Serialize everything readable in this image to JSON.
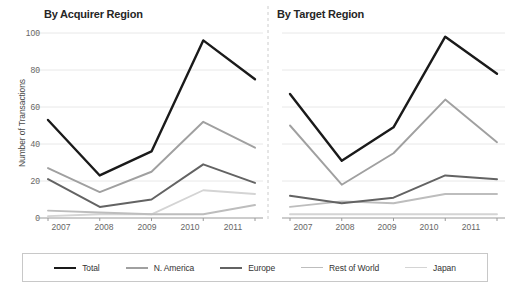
{
  "chart_data": [
    {
      "type": "line",
      "title": "By Acquirer Region",
      "xlabel": "",
      "ylabel": "Number of Transactions",
      "categories": [
        "2007",
        "2008",
        "2009",
        "2010",
        "2011"
      ],
      "ylim": [
        0,
        100
      ],
      "yticks": [
        0,
        20,
        40,
        60,
        80,
        100
      ],
      "grid": "horizontal",
      "legend_position": "bottom",
      "series": [
        {
          "name": "Total",
          "values": [
            53,
            23,
            36,
            96,
            75
          ],
          "color": "#1a1a1a"
        },
        {
          "name": "N. America",
          "values": [
            27,
            14,
            25,
            52,
            38
          ],
          "color": "#a0a0a0"
        },
        {
          "name": "Europe",
          "values": [
            21,
            6,
            10,
            29,
            19
          ],
          "color": "#636363"
        },
        {
          "name": "Rest of World",
          "values": [
            4,
            3,
            2,
            2,
            7
          ],
          "color": "#bdbdbd"
        },
        {
          "name": "Japan",
          "values": [
            1,
            2,
            2,
            15,
            13
          ],
          "color": "#d4d4d4"
        }
      ]
    },
    {
      "type": "line",
      "title": "By Target Region",
      "xlabel": "",
      "ylabel": "Number of Transactions",
      "categories": [
        "2007",
        "2008",
        "2009",
        "2010",
        "2011"
      ],
      "ylim": [
        0,
        100
      ],
      "yticks": [
        0,
        20,
        40,
        60,
        80,
        100
      ],
      "grid": "horizontal",
      "legend_position": "bottom",
      "series": [
        {
          "name": "Total",
          "values": [
            67,
            31,
            49,
            98,
            78
          ],
          "color": "#1a1a1a"
        },
        {
          "name": "N. America",
          "values": [
            50,
            18,
            35,
            64,
            41
          ],
          "color": "#a0a0a0"
        },
        {
          "name": "Europe",
          "values": [
            12,
            8,
            11,
            23,
            21
          ],
          "color": "#636363"
        },
        {
          "name": "Rest of World",
          "values": [
            6,
            9,
            8,
            13,
            13
          ],
          "color": "#bdbdbd"
        },
        {
          "name": "Japan",
          "values": [
            2,
            2,
            2,
            2,
            2
          ],
          "color": "#d4d4d4"
        }
      ]
    }
  ],
  "axes": {
    "ylabel": "Number of Transactions",
    "yticks": [
      "100",
      "80",
      "60",
      "40",
      "20",
      "0"
    ],
    "xticks": [
      "2007",
      "2008",
      "2009",
      "2010",
      "2011"
    ]
  },
  "panels": {
    "left_title": "By Acquirer Region",
    "right_title": "By Target Region"
  },
  "legend": {
    "items": [
      {
        "label": "Total",
        "color": "#1a1a1a",
        "width": 2.6
      },
      {
        "label": "N. America",
        "color": "#a0a0a0",
        "width": 2.0
      },
      {
        "label": "Europe",
        "color": "#636363",
        "width": 2.2
      },
      {
        "label": "Rest of World",
        "color": "#bdbdbd",
        "width": 1.8
      },
      {
        "label": "Japan",
        "color": "#d4d4d4",
        "width": 1.8
      }
    ]
  },
  "style": {
    "grid_color": "#e8e8e8",
    "axis_color": "#9a9a9a",
    "divider_color": "#cccccc",
    "background": "#ffffff"
  }
}
